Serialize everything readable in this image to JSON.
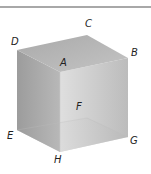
{
  "figure": {
    "type": "cube",
    "vertices": {
      "A": "A",
      "B": "B",
      "C": "C",
      "D": "D",
      "E": "E",
      "F": "F",
      "G": "G",
      "H": "H"
    },
    "colors": {
      "top_face": "#b2b2b2",
      "left_face": "#a6a6a6",
      "right_face": "#cfcfcf",
      "bottom_face": "#e2e2e2",
      "rule": "#a8a8a8"
    }
  }
}
